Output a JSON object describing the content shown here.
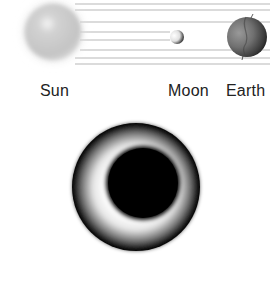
{
  "labels": {
    "sun": "Sun",
    "moon": "Moon",
    "earth": "Earth"
  },
  "bodies": [
    {
      "name": "sun",
      "cx": 53,
      "cy": 32,
      "r": 28,
      "color": "#c8c8c8"
    },
    {
      "name": "moon",
      "cx": 177,
      "cy": 37,
      "r": 7,
      "color": "#e8e8e8"
    },
    {
      "name": "earth",
      "cx": 247,
      "cy": 37,
      "r": 20,
      "color": "#555555"
    }
  ],
  "rays_y": [
    4,
    10,
    22,
    32,
    40,
    50,
    58,
    64
  ],
  "eclipse": {
    "cx": 136,
    "cy": 187,
    "r": 64,
    "moon_cx": 143,
    "moon_cy": 183,
    "moon_r": 37,
    "corona_color": "#f2f2f2",
    "dark_color": "#000000"
  }
}
